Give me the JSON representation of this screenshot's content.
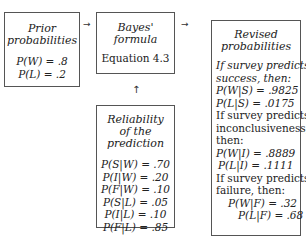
{
  "diagram": {
    "prior": {
      "title_lines": [
        "Prior",
        "probabilities"
      ],
      "values": [
        "P(W) = .8",
        "P(L) = .2"
      ]
    },
    "bayes": {
      "title_lines": [
        "Bayes'",
        "formula"
      ],
      "subtitle": "Equation 4.3"
    },
    "reliability": {
      "title_lines": [
        "Reliability",
        "of the",
        "prediction"
      ],
      "values": [
        "P(S|W) = .70",
        "P(I|W) = .20",
        "P(F|W) = .10",
        "P(S|L) = .05",
        "P(I|L) = .10",
        "P(F|L) = .85"
      ]
    },
    "revised": {
      "title_lines": [
        "Revised",
        "probabilities"
      ],
      "success_header": [
        "If survey predicts",
        "success, then:"
      ],
      "success_values": [
        "P(W|S) = .9825",
        "P(L|S) = .0175"
      ],
      "inconclusive_header": [
        "If survey predicts",
        "inconclusiveness,",
        "then:"
      ],
      "inconclusive_values": [
        "P(W|I) = .8889",
        "P(L|I) = .1111"
      ],
      "failure_header": [
        "If survey predicts",
        "failure, then:"
      ],
      "failure_values": [
        "P(W|F) = .32",
        "P(L|F) = .68"
      ]
    },
    "arrows": {
      "right": "→",
      "up": "↑"
    }
  }
}
